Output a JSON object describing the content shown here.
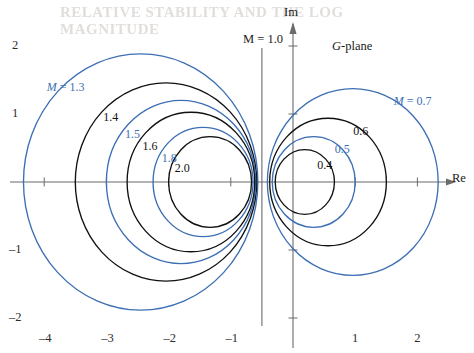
{
  "figure": {
    "plane_label_prefix": "G",
    "plane_label_suffix": "-plane",
    "axis_real_label": "Re",
    "axis_imag_label": "Im",
    "vertical_asymptote_label": "M = 1.0",
    "colors": {
      "blue": "#3d6fb4",
      "black": "#111111",
      "axis": "#6b6b6b",
      "background": "#ffffff"
    },
    "ghost_text_top": "RELATIVE STABILITY AND THE LOG MAGNITUDE"
  },
  "chart_data": {
    "type": "line",
    "xlabel": "Re",
    "ylabel": "Im",
    "xlim": [
      -4.7,
      2.9
    ],
    "ylim": [
      -2.5,
      2.5
    ],
    "grid": false,
    "legend": "inline-curve-labels",
    "x_ticks": [
      -4,
      -3,
      -2,
      -1,
      1,
      2
    ],
    "x_tick_labels": [
      "–4",
      "–3",
      "–2",
      "–1",
      "1",
      "2"
    ],
    "y_ticks": [
      2,
      1,
      -1,
      -2
    ],
    "y_tick_labels": [
      "2",
      "1",
      "–1",
      "–2"
    ],
    "asymptote": {
      "type": "vertical",
      "x": -0.5,
      "label": "M = 1.0"
    },
    "series": [
      {
        "name": "M = 1.3",
        "M": 1.3,
        "center_x": -2.449,
        "center_y": 0,
        "radius": 1.884,
        "color": "blue",
        "label": "M = 1.3",
        "label_x": -3.96,
        "label_y": 1.48
      },
      {
        "name": "M = 1.4",
        "M": 1.4,
        "center_x": -2.042,
        "center_y": 0,
        "radius": 1.458,
        "color": "black",
        "label": "1.4",
        "label_x": -3.05,
        "label_y": 1.05
      },
      {
        "name": "M = 1.5",
        "M": 1.5,
        "center_x": -1.8,
        "center_y": 0,
        "radius": 1.2,
        "color": "blue",
        "label": "1.5",
        "label_x": -2.7,
        "label_y": 0.8
      },
      {
        "name": "M = 1.6",
        "M": 1.6,
        "center_x": -1.641,
        "center_y": 0,
        "radius": 1.026,
        "color": "black",
        "label": "1.6",
        "label_x": -2.42,
        "label_y": 0.62
      },
      {
        "name": "M = 1.8",
        "M": 1.8,
        "center_x": -1.446,
        "center_y": 0,
        "radius": 0.804,
        "color": "blue",
        "label": "1.8",
        "label_x": -2.11,
        "label_y": 0.44
      },
      {
        "name": "M = 2.0",
        "M": 2.0,
        "center_x": -1.333,
        "center_y": 0,
        "radius": 0.667,
        "color": "black",
        "label": "2.0",
        "label_x": -1.9,
        "label_y": 0.3
      },
      {
        "name": "M = 0.7",
        "M": 0.7,
        "center_x": 0.961,
        "center_y": 0,
        "radius": 1.373,
        "color": "blue",
        "label": "M = 0.7",
        "label_x": 1.62,
        "label_y": 1.28
      },
      {
        "name": "M = 0.6",
        "M": 0.6,
        "center_x": 0.563,
        "center_y": 0,
        "radius": 0.938,
        "color": "black",
        "label": "0.6",
        "label_x": 0.97,
        "label_y": 0.84
      },
      {
        "name": "M = 0.5",
        "M": 0.5,
        "center_x": 0.333,
        "center_y": 0,
        "radius": 0.667,
        "color": "blue",
        "label": "0.5",
        "label_x": 0.67,
        "label_y": 0.58
      },
      {
        "name": "M = 0.4",
        "M": 0.4,
        "center_x": 0.19,
        "center_y": 0,
        "radius": 0.476,
        "color": "black",
        "label": "0.4",
        "label_x": 0.39,
        "label_y": 0.34
      }
    ]
  }
}
